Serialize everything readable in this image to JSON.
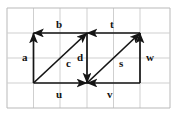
{
  "figure": {
    "canvas": {
      "width": 186,
      "height": 123,
      "background": "#ffffff"
    },
    "grid": {
      "color": "#cfcfcf",
      "border_color": "#b9b9b9",
      "x_lines": [
        7,
        33.5,
        60,
        87,
        113.5,
        140,
        170
      ],
      "y_lines": [
        8,
        33,
        58,
        83,
        108
      ],
      "columns": 6,
      "rows": 4
    },
    "style": {
      "vector_color": "#151515",
      "label_color": "#121212",
      "stroke_width": 1.7
    }
  },
  "chart_data": {
    "type": "diagram",
    "xlabel": "",
    "ylabel": "",
    "grid": true,
    "legend": "none",
    "vertices": {
      "top_left": [
        33.5,
        33
      ],
      "bottom_left": [
        33.5,
        83
      ],
      "top_center": [
        87,
        33
      ],
      "bottom_center": [
        87,
        83
      ],
      "top_right": [
        140,
        33
      ],
      "bottom_right": [
        140,
        83
      ]
    },
    "vectors": [
      {
        "name": "a",
        "from": [
          33.5,
          83
        ],
        "to": [
          33.5,
          33
        ],
        "direction": "up",
        "label": "a",
        "label_x": 22,
        "label_y": 52
      },
      {
        "name": "b",
        "from": [
          87,
          33
        ],
        "to": [
          33.5,
          33
        ],
        "direction": "left",
        "label": "b",
        "label_x": 56,
        "label_y": 19
      },
      {
        "name": "c",
        "from": [
          33.5,
          83
        ],
        "to": [
          87,
          33
        ],
        "direction": "up-right",
        "label": "c",
        "label_x": 66,
        "label_y": 58
      },
      {
        "name": "u",
        "from": [
          33.5,
          83
        ],
        "to": [
          87,
          83
        ],
        "direction": "right",
        "label": "u",
        "label_x": 56,
        "label_y": 89
      },
      {
        "name": "d",
        "from": [
          87,
          33
        ],
        "to": [
          87,
          83
        ],
        "direction": "down",
        "label": "d",
        "label_x": 77,
        "label_y": 52
      },
      {
        "name": "t",
        "from": [
          140,
          33
        ],
        "to": [
          87,
          33
        ],
        "direction": "left",
        "label": "t",
        "label_x": 110,
        "label_y": 19
      },
      {
        "name": "s",
        "from": [
          87,
          83
        ],
        "to": [
          140,
          33
        ],
        "direction": "up-right",
        "label": "s",
        "label_x": 119,
        "label_y": 58
      },
      {
        "name": "w",
        "from": [
          140,
          83
        ],
        "to": [
          140,
          33
        ],
        "direction": "up",
        "label": "w",
        "label_x": 146,
        "label_y": 52
      },
      {
        "name": "v",
        "from": [
          140,
          83
        ],
        "to": [
          87,
          83
        ],
        "direction": "left",
        "label": "v",
        "label_x": 107,
        "label_y": 89
      }
    ]
  }
}
